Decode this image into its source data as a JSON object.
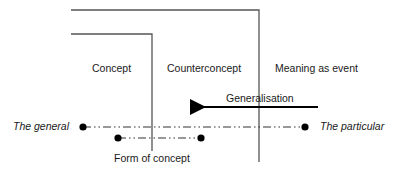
{
  "diagram": {
    "labels": {
      "concept": "Concept",
      "counterconcept": "Counterconcept",
      "meaning_as_event": "Meaning as event",
      "generalisation": "Generalisation",
      "the_general": "The general",
      "the_particular": "The particular",
      "form_of_concept": "Form of concept"
    },
    "colors": {
      "line": "#444444",
      "text": "#1a1a1a",
      "dot": "#000000"
    }
  }
}
